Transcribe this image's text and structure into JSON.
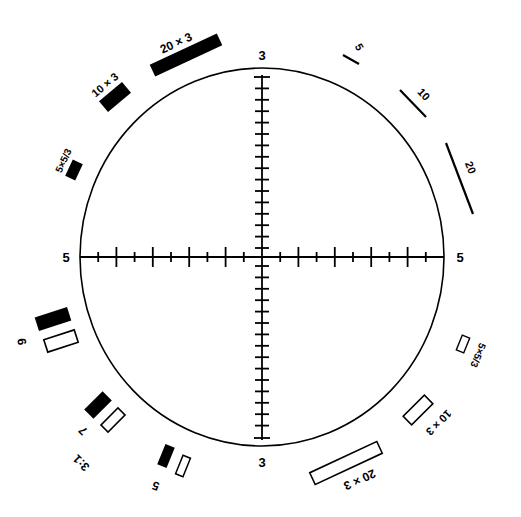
{
  "diagram": {
    "type": "reticle-test-chart",
    "circle": {
      "cx": 262,
      "cy": 257,
      "rx": 182,
      "ry": 189,
      "stroke": "#000000"
    },
    "axis_labels": {
      "top": "3",
      "bottom": "3",
      "left": "5",
      "right": "5"
    },
    "horizontal_axis": {
      "x1": 80,
      "x2": 444,
      "y": 257,
      "intervals": 20,
      "tick_pattern": "alternating long/short"
    },
    "vertical_axis": {
      "y1": 75,
      "y2": 440,
      "x": 262,
      "intervals": 32
    },
    "top_left_bars": [
      {
        "label": "20 × 3",
        "fill": "#000000"
      },
      {
        "label": "10 × 3",
        "fill": "#000000"
      },
      {
        "label": "5×5/3",
        "fill": "#000000"
      }
    ],
    "top_right_lines": [
      {
        "label": "5"
      },
      {
        "label": "10"
      },
      {
        "label": "20"
      }
    ],
    "bottom_left_pairs": [
      {
        "label": "9",
        "black": true,
        "white": true
      },
      {
        "label": "7",
        "black": true,
        "white": true
      },
      {
        "label": "5",
        "black": true,
        "white": true
      }
    ],
    "bottom_left_ratio_label": "3:1",
    "bottom_right_bars": [
      {
        "label": "5×5/3",
        "fill": "#ffffff"
      },
      {
        "label": "10 × 3",
        "fill": "#ffffff"
      },
      {
        "label": "20 × 3",
        "fill": "#ffffff"
      }
    ]
  }
}
